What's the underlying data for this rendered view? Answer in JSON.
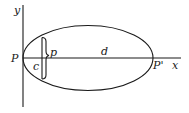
{
  "diagram": {
    "type": "ellipse-orbit-diagram",
    "axes": {
      "x_label": "x",
      "y_label": "y"
    },
    "points": {
      "left_vertex_label": "P",
      "right_vertex_label": "P'"
    },
    "segments": {
      "major_axis_label": "d",
      "focal_offset_label": "c",
      "semi_latus_rectum_label": "p"
    },
    "colors": {
      "stroke": "#1a1a1a",
      "background": "#ffffff"
    }
  }
}
